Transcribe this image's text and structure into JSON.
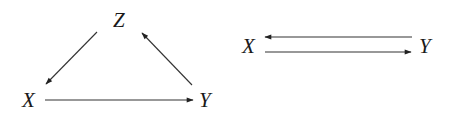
{
  "diagrams": [
    {
      "id": "triangle",
      "nodes": [
        {
          "label": "Z",
          "x": 120,
          "y": 27
        },
        {
          "label": "X",
          "x": 30,
          "y": 107
        },
        {
          "label": "Y",
          "x": 206,
          "y": 107
        }
      ],
      "edges": [
        {
          "from": "Z",
          "to": "X"
        },
        {
          "from": "Y",
          "to": "Z"
        },
        {
          "from": "X",
          "to": "Y"
        }
      ]
    },
    {
      "id": "bidirectional",
      "nodes": [
        {
          "label": "X",
          "x": 250,
          "y": 53
        },
        {
          "label": "Y",
          "x": 425,
          "y": 53
        }
      ],
      "edges": [
        {
          "from": "Y",
          "to": "X"
        },
        {
          "from": "X",
          "to": "Y"
        }
      ]
    }
  ],
  "colors": {
    "stroke": "#333333",
    "text": "#1a1a1a"
  }
}
